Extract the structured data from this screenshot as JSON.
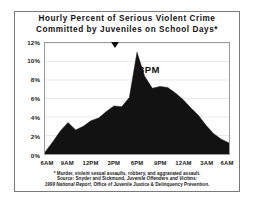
{
  "title": {
    "line1": "Hourly Percent of Serious Violent Crime",
    "line2": "Committed by Juveniles on School Days*"
  },
  "annotation": {
    "peak_label": "3PM",
    "peak_marker_icon": "down-triangle-marker"
  },
  "footnote": {
    "line1": "* Murder, violent sexual assaults, robbery, and aggravated assault.",
    "line2_prefix": "Source: Snyder and Sickmund, ",
    "line2_italic": "Juvenile Offenders and Victims:",
    "line3_italic": "1999 National Report",
    "line3_suffix": ", Office of Juvenile Justice & Delinquency Prevention."
  },
  "colors": {
    "area_fill": "#121212",
    "frame": "#7a7a7a",
    "plot_border": "#9a9a9a",
    "grid": "#d9d9d9",
    "text": "#1a1a1a"
  },
  "chart_data": {
    "type": "area",
    "title": "Hourly Percent of Serious Violent Crime Committed by Juveniles on School Days*",
    "xlabel": "",
    "ylabel": "",
    "ylim": [
      0,
      12
    ],
    "xlim": [
      0,
      24
    ],
    "grid": true,
    "legend": "none",
    "ytick_labels": [
      "12%",
      "10%",
      "8%",
      "6%",
      "4%",
      "2%",
      "0%"
    ],
    "ytick_values": [
      12,
      10,
      8,
      6,
      4,
      2,
      0
    ],
    "xtick_labels": [
      "6AM",
      "9AM",
      "12PM",
      "3PM",
      "6PM",
      "9PM",
      "12AM",
      "3AM",
      "6AM"
    ],
    "xtick_values": [
      0,
      3,
      6,
      9,
      12,
      15,
      18,
      21,
      24
    ],
    "x": [
      0,
      1,
      2,
      3,
      4,
      5,
      6,
      7,
      8,
      9,
      10,
      11,
      12,
      13,
      14,
      15,
      16,
      17,
      18,
      19,
      20,
      21,
      22,
      23,
      24
    ],
    "categories": [
      "6AM",
      "7AM",
      "8AM",
      "9AM",
      "10AM",
      "11AM",
      "12PM",
      "1PM",
      "2PM",
      "3PM",
      "4PM",
      "5PM",
      "6PM",
      "7PM",
      "8PM",
      "9PM",
      "10PM",
      "11PM",
      "12AM",
      "1AM",
      "2AM",
      "3AM",
      "4AM",
      "5AM",
      "6AM"
    ],
    "values": [
      0.2,
      1.3,
      2.5,
      3.4,
      2.6,
      3.0,
      3.6,
      3.9,
      4.6,
      5.2,
      5.1,
      6.1,
      11.0,
      8.4,
      7.1,
      7.3,
      7.2,
      6.6,
      5.9,
      5.0,
      4.2,
      3.1,
      2.2,
      1.6,
      1.2
    ],
    "annotations": [
      {
        "text": "3PM",
        "x": 9,
        "y": 11.0,
        "marker": "down-triangle"
      }
    ]
  }
}
